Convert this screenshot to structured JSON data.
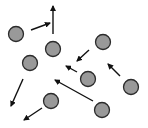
{
  "diagram": {
    "type": "particle-velocity-diagram",
    "width": 148,
    "height": 128,
    "colors": {
      "background": "#ffffff",
      "particle_fill": "#999999",
      "particle_stroke": "#2b2b2b",
      "arrow": "#111111"
    },
    "particle_radius": 7.5,
    "particles": [
      {
        "id": "p1",
        "cx": 16,
        "cy": 34
      },
      {
        "id": "p2",
        "cx": 53,
        "cy": 49
      },
      {
        "id": "p3",
        "cx": 103,
        "cy": 42
      },
      {
        "id": "p4",
        "cx": 30,
        "cy": 63
      },
      {
        "id": "p5",
        "cx": 88,
        "cy": 79
      },
      {
        "id": "p6",
        "cx": 131,
        "cy": 87
      },
      {
        "id": "p7",
        "cx": 51,
        "cy": 101
      },
      {
        "id": "p8",
        "cx": 102,
        "cy": 110
      }
    ],
    "arrows": [
      {
        "id": "a1",
        "x1": 31,
        "y1": 30,
        "x2": 50,
        "y2": 23
      },
      {
        "id": "a2",
        "x1": 53,
        "y1": 34,
        "x2": 53,
        "y2": 6
      },
      {
        "id": "a3",
        "x1": 89,
        "y1": 50,
        "x2": 77,
        "y2": 61
      },
      {
        "id": "a4",
        "x1": 77,
        "y1": 72,
        "x2": 66,
        "y2": 66
      },
      {
        "id": "a5",
        "x1": 120,
        "y1": 76,
        "x2": 108,
        "y2": 64
      },
      {
        "id": "a6",
        "x1": 93,
        "y1": 101,
        "x2": 55,
        "y2": 80
      },
      {
        "id": "a7",
        "x1": 23,
        "y1": 79,
        "x2": 11,
        "y2": 106
      },
      {
        "id": "a8",
        "x1": 42,
        "y1": 108,
        "x2": 24,
        "y2": 120
      }
    ]
  }
}
